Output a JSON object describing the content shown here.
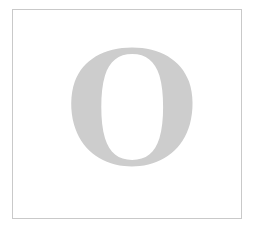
{
  "card": {
    "background_color": "#ffffff",
    "border_color": "#c9c9c9",
    "border_width_px": 1
  },
  "glyph": {
    "character": "O",
    "name": "letter-o",
    "style": "serif-roman-high-contrast",
    "fill_color": "#cdcdcd",
    "description": "Large light gray capital letter O"
  },
  "page": {
    "background_color": "#ffffff"
  }
}
